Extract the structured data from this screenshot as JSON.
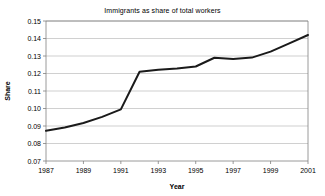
{
  "chart_data": {
    "type": "line",
    "title": "Immigrants as share of total workers",
    "xlabel": "Year",
    "ylabel": "Share",
    "grid": true,
    "legend": "none",
    "xlim": [
      1987,
      2001
    ],
    "ylim": [
      0.07,
      0.15
    ],
    "x": [
      1987,
      1988,
      1989,
      1990,
      1991,
      1992,
      1993,
      1994,
      1995,
      1996,
      1997,
      1998,
      1999,
      2000,
      2001
    ],
    "values": [
      0.0873,
      0.0891,
      0.0917,
      0.0952,
      0.0995,
      0.121,
      0.1222,
      0.1228,
      0.124,
      0.129,
      0.1283,
      0.1291,
      0.1325,
      0.1372,
      0.142
    ],
    "series": [
      {
        "name": "Immigrant share",
        "values": [
          0.0873,
          0.0891,
          0.0917,
          0.0952,
          0.0995,
          0.121,
          0.1222,
          0.1228,
          0.124,
          0.129,
          0.1283,
          0.1291,
          0.1325,
          0.1372,
          0.142
        ],
        "color": "#1a1a1a"
      }
    ],
    "ytick_labels": [
      "0.15",
      "0.14",
      "0.13",
      "0.12",
      "0.11",
      "0.10",
      "0.09",
      "0.08",
      "0.07"
    ],
    "ytick_values": [
      0.15,
      0.14,
      0.13,
      0.12,
      0.11,
      0.1,
      0.09,
      0.08,
      0.07
    ],
    "xtick_labels": [
      "1987",
      "1989",
      "1991",
      "1993",
      "1995",
      "1997",
      "1999",
      "2001"
    ],
    "xtick_values": [
      1987,
      1989,
      1991,
      1993,
      1995,
      1997,
      1999,
      2001
    ]
  },
  "colors": {
    "line": "#1a1a1a",
    "grid": "#b0b0b0",
    "axis": "#808080",
    "background": "#ffffff"
  }
}
